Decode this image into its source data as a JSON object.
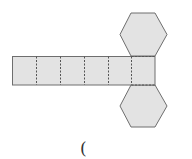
{
  "diagram": {
    "type": "hexagonal-prism-net",
    "fill_color": "#e3e3e3",
    "stroke_color": "#6e6e6e",
    "fold_line_style": "dashed",
    "rectangle_faces": 6,
    "hexagon_faces": 2
  },
  "caption": {
    "text": "("
  }
}
